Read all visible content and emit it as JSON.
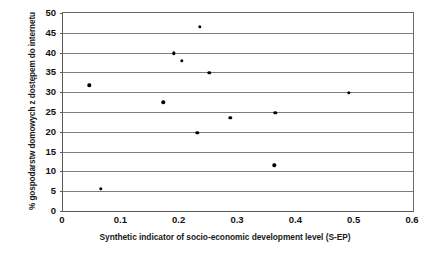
{
  "chart_data": {
    "type": "scatter",
    "title": "",
    "xlabel": "Synthetic indicator of socio-economic development level (S-EP)",
    "ylabel": "% gospodarstw domowych z dostępem do internetu",
    "xlim": [
      0,
      0.6
    ],
    "ylim": [
      0,
      50
    ],
    "x_ticks": [
      "0",
      "0.1",
      "0.2",
      "0.3",
      "0.4",
      "0.5",
      "0.6"
    ],
    "x_tick_values": [
      0,
      0.1,
      0.2,
      0.3,
      0.4,
      0.5,
      0.6
    ],
    "y_ticks": [
      "0",
      "5",
      "10",
      "15",
      "20",
      "25",
      "30",
      "35",
      "40",
      "45",
      "50"
    ],
    "y_tick_values": [
      0,
      5,
      10,
      15,
      20,
      25,
      30,
      35,
      40,
      45,
      50
    ],
    "grid": "horizontal",
    "legend": "none",
    "marker": "filled-circle",
    "marker_color": "#000000",
    "points": [
      {
        "x": 0.045,
        "y": 31.7
      },
      {
        "x": 0.065,
        "y": 5.6
      },
      {
        "x": 0.172,
        "y": 27.4
      },
      {
        "x": 0.19,
        "y": 39.8
      },
      {
        "x": 0.204,
        "y": 38.0
      },
      {
        "x": 0.23,
        "y": 19.8
      },
      {
        "x": 0.234,
        "y": 46.5
      },
      {
        "x": 0.251,
        "y": 34.9
      },
      {
        "x": 0.287,
        "y": 23.5
      },
      {
        "x": 0.362,
        "y": 11.5
      },
      {
        "x": 0.364,
        "y": 24.8
      },
      {
        "x": 0.49,
        "y": 29.8
      }
    ]
  },
  "colors": {
    "axis": "#5a5a5a",
    "gridline": "#7d7d7d",
    "marker": "#000000",
    "text": "#111111",
    "background": "#ffffff"
  }
}
